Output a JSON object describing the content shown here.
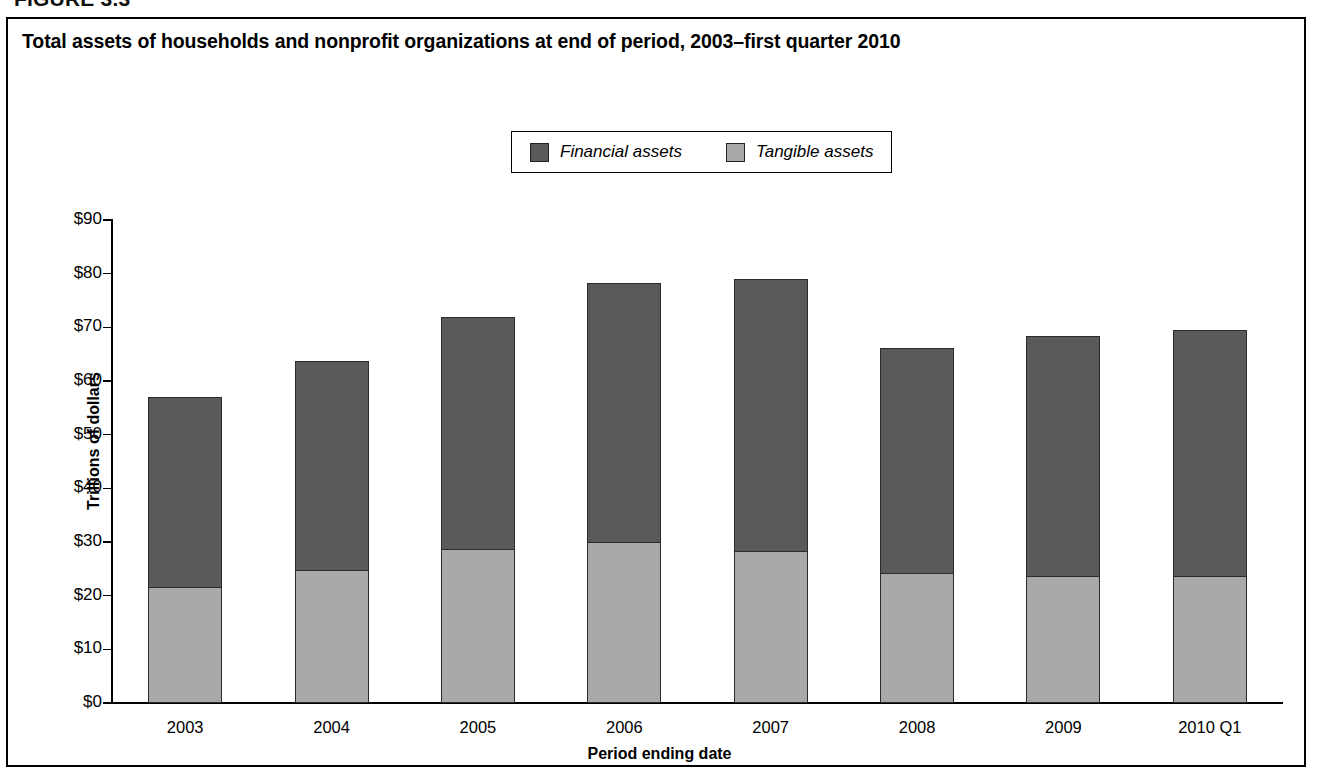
{
  "figure": {
    "number_label": "FIGURE 3.3"
  },
  "chart_title": "Total assets of households and nonprofit organizations at end of period, 2003–first quarter 2010",
  "legend": {
    "entries": [
      {
        "label": "Financial assets",
        "color": "#5a5a5a",
        "swatch_name": "financial-assets-swatch"
      },
      {
        "label": "Tangible assets",
        "color": "#a9a9a9",
        "swatch_name": "tangible-assets-swatch"
      }
    ]
  },
  "axes": {
    "y_title": "Trillions of dollars",
    "x_title": "Period ending date",
    "y_ticks": [
      "$90",
      "$80",
      "$70",
      "$60",
      "$50",
      "$40",
      "$30",
      "$20",
      "$10",
      "$0"
    ]
  },
  "chart_data": {
    "type": "bar",
    "stacked": true,
    "title": "Total assets of households and nonprofit organizations at end of period, 2003–first quarter 2010",
    "xlabel": "Period ending date",
    "ylabel": "Trillions of dollars",
    "ylim": [
      0,
      90
    ],
    "ytick_step": 10,
    "ytick_values": [
      0,
      10,
      20,
      30,
      40,
      50,
      60,
      70,
      80,
      90
    ],
    "ytick_labels": [
      "$0",
      "$10",
      "$20",
      "$30",
      "$40",
      "$50",
      "$60",
      "$70",
      "$80",
      "$90"
    ],
    "grid": false,
    "legend_position": "top-center",
    "categories": [
      "2003",
      "2004",
      "2005",
      "2006",
      "2007",
      "2008",
      "2009",
      "2010 Q1"
    ],
    "series": [
      {
        "name": "Tangible assets",
        "color": "#a9a9a9",
        "values": [
          21.8,
          24.8,
          28.7,
          30.1,
          28.4,
          24.4,
          23.8,
          23.8
        ]
      },
      {
        "name": "Financial assets",
        "color": "#5a5a5a",
        "values": [
          35.2,
          38.9,
          43.3,
          48.1,
          50.7,
          41.7,
          44.5,
          45.7
        ]
      }
    ],
    "totals": [
      57.0,
      63.7,
      72.0,
      78.2,
      79.1,
      66.1,
      68.3,
      69.5
    ]
  }
}
